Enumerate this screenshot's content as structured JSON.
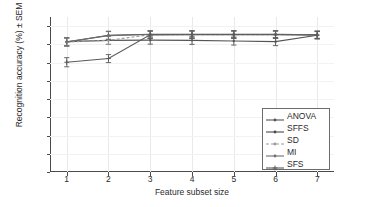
{
  "chart_data": {
    "type": "line",
    "title": "",
    "xlabel": "Feature subset size",
    "ylabel": "Recognition accuracy (%) ± SEM",
    "x": [
      1,
      2,
      3,
      4,
      5,
      6,
      7
    ],
    "xlim": [
      0.6,
      7.4
    ],
    "ylim": [
      0,
      0.85
    ],
    "xticks": [
      "1",
      "2",
      "3",
      "4",
      "5",
      "6",
      "7"
    ],
    "yticks": [
      "0",
      "0.1",
      "0.2",
      "0.3",
      "0.4",
      "0.5",
      "0.6",
      "0.7",
      "0.8"
    ],
    "grid": true,
    "legend_position": "lower right",
    "errorbars": true,
    "series": [
      {
        "name": "ANOVA",
        "color": "#555555",
        "marker": "dot",
        "linestyle": "solid",
        "values": [
          0.715,
          0.722,
          0.723,
          0.722,
          0.718,
          0.715,
          0.75
        ],
        "errors": [
          0.022,
          0.022,
          0.022,
          0.022,
          0.022,
          0.022,
          0.02
        ]
      },
      {
        "name": "SFFS",
        "color": "#4a4a4a",
        "marker": "dot",
        "linestyle": "solid",
        "values": [
          0.712,
          0.75,
          0.755,
          0.755,
          0.755,
          0.755,
          0.753
        ],
        "errors": [
          0.022,
          0.022,
          0.02,
          0.02,
          0.02,
          0.02,
          0.02
        ]
      },
      {
        "name": "SD",
        "color": "#9a9a9a",
        "marker": "dot",
        "linestyle": "dashed",
        "values": [
          0.713,
          0.722,
          0.753,
          0.753,
          0.753,
          0.753,
          0.752
        ],
        "errors": [
          0.022,
          0.022,
          0.02,
          0.02,
          0.02,
          0.02,
          0.02
        ]
      },
      {
        "name": "MI",
        "color": "#6e6e6e",
        "marker": "dot",
        "linestyle": "solid",
        "values": [
          0.714,
          0.748,
          0.754,
          0.754,
          0.754,
          0.754,
          0.751
        ],
        "errors": [
          0.022,
          0.022,
          0.02,
          0.02,
          0.02,
          0.02,
          0.02
        ]
      },
      {
        "name": "SFS",
        "color": "#5a5a5a",
        "marker": "plus",
        "linestyle": "solid",
        "values": [
          0.602,
          0.622,
          0.752,
          0.753,
          0.753,
          0.753,
          0.751
        ],
        "errors": [
          0.025,
          0.022,
          0.02,
          0.02,
          0.02,
          0.02,
          0.02
        ]
      }
    ]
  },
  "axes": {
    "x_title": "Feature subset size",
    "y_title": "Recognition accuracy (%) ± SEM"
  },
  "legend": {
    "items": [
      {
        "label": "ANOVA"
      },
      {
        "label": "SFFS"
      },
      {
        "label": "SD"
      },
      {
        "label": "MI"
      },
      {
        "label": "SFS"
      }
    ]
  }
}
